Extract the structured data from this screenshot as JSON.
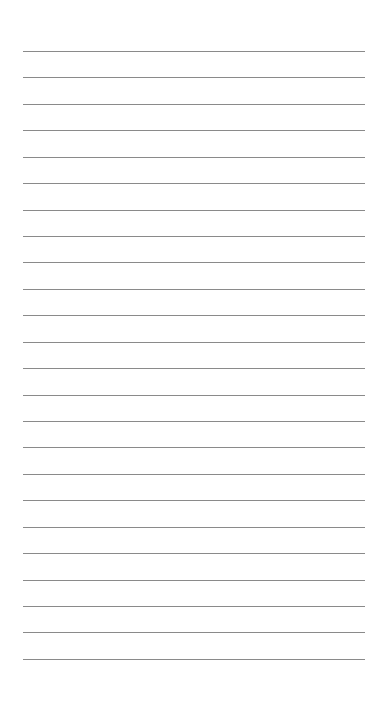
{
  "page": {
    "type": "lined-paper",
    "background_color": "#ffffff",
    "line_color": "#8a8a8a",
    "line_count": 24,
    "first_line_y": 51,
    "line_spacing": 26.43,
    "line_left": 23,
    "line_width": 342
  }
}
